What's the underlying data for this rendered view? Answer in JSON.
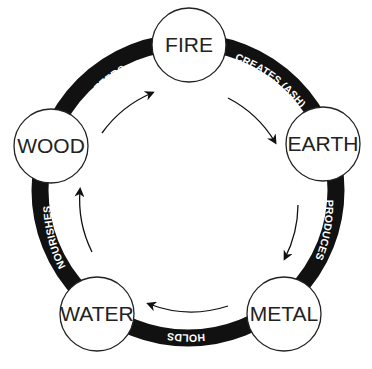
{
  "diagram": {
    "colors": {
      "background": "#ffffff",
      "band": "#111111",
      "node_fill": "#ffffff",
      "node_stroke": "#222222",
      "label_text": "#ffffff",
      "node_text": "#222222"
    },
    "nodes": [
      {
        "id": "fire",
        "label": "FIRE"
      },
      {
        "id": "earth",
        "label": "EARTH"
      },
      {
        "id": "metal",
        "label": "METAL"
      },
      {
        "id": "water",
        "label": "WATER"
      },
      {
        "id": "wood",
        "label": "WOOD"
      }
    ],
    "edges": [
      {
        "from": "fire",
        "to": "earth",
        "label": "CREATES (ASH)"
      },
      {
        "from": "earth",
        "to": "metal",
        "label": "PRODUCES"
      },
      {
        "from": "metal",
        "to": "water",
        "label": "HOLDS"
      },
      {
        "from": "water",
        "to": "wood",
        "label": "NOURISHES"
      },
      {
        "from": "wood",
        "to": "fire",
        "label": "FEEDS"
      }
    ],
    "direction": "clockwise"
  }
}
